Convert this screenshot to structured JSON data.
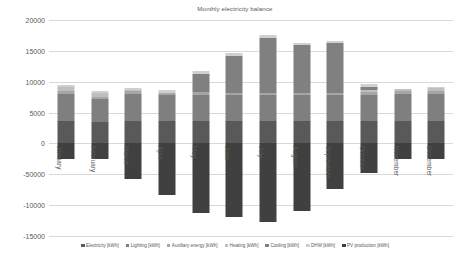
{
  "chart_data": {
    "type": "bar",
    "title": "Monthly electricity balance",
    "xlabel": "",
    "ylabel": "",
    "ylim": [
      -15000,
      20000
    ],
    "ytick_step": 5000,
    "ytick_labels": [
      "20000",
      "15000",
      "10000",
      "5000",
      "0",
      "-50000",
      "-10000",
      "-15000"
    ],
    "ytick_values": [
      20000,
      15000,
      10000,
      5000,
      0,
      -5000,
      -10000,
      -15000
    ],
    "grid": true,
    "stacked": true,
    "legend_position": "bottom",
    "categories": [
      "January",
      "February",
      "March",
      "April",
      "May",
      "June",
      "July",
      "August",
      "September",
      "October",
      "November",
      "December"
    ],
    "series": [
      {
        "name": "Electricity [kWh]",
        "color": "#595959",
        "values": [
          3600,
          3400,
          3700,
          3600,
          3600,
          3600,
          3600,
          3600,
          3600,
          3600,
          3600,
          3600
        ]
      },
      {
        "name": "Lighting [kWh]",
        "color": "#7f7f7f",
        "values": [
          4400,
          3800,
          4300,
          4200,
          4300,
          4200,
          4200,
          4200,
          4200,
          4300,
          4400,
          4400
        ]
      },
      {
        "name": "Auxiliary energy [kWh]",
        "color": "#a6a6a6",
        "values": [
          500,
          400,
          500,
          400,
          400,
          400,
          400,
          400,
          400,
          500,
          500,
          500
        ]
      },
      {
        "name": "Heating [kWh]",
        "color": "#bfbfbf",
        "values": [
          600,
          500,
          200,
          0,
          0,
          0,
          0,
          0,
          0,
          200,
          400,
          500
        ]
      },
      {
        "name": "Cooling [kWh]",
        "color": "#808080",
        "values": [
          0,
          0,
          0,
          0,
          2900,
          5900,
          8900,
          7700,
          8100,
          600,
          0,
          0
        ]
      },
      {
        "name": "DHW [kWh]",
        "color": "#d0d0d0",
        "values": [
          400,
          400,
          300,
          400,
          500,
          500,
          500,
          300,
          300,
          400,
          0,
          200
        ]
      },
      {
        "name": "PV production [kWh]",
        "color": "#404040",
        "values": [
          -2500,
          -2500,
          -5700,
          -8400,
          -11300,
          -11900,
          -12800,
          -11000,
          -7400,
          -4800,
          -2500,
          -2600
        ]
      }
    ]
  },
  "legend": {
    "items": [
      {
        "label": "Electricity [kWh]",
        "color": "#595959"
      },
      {
        "label": "Lighting [kWh]",
        "color": "#7f7f7f"
      },
      {
        "label": "Auxiliary energy [kWh]",
        "color": "#a6a6a6"
      },
      {
        "label": "Heating [kWh]",
        "color": "#bfbfbf"
      },
      {
        "label": "Cooling [kWh]",
        "color": "#808080"
      },
      {
        "label": "DHW [kWh]",
        "color": "#d0d0d0"
      },
      {
        "label": "PV production [kWh]",
        "color": "#404040"
      }
    ]
  }
}
